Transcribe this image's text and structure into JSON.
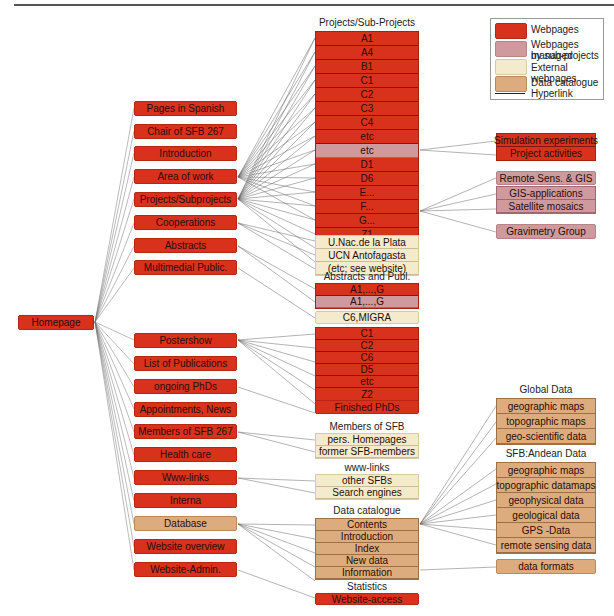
{
  "colors": {
    "webpages": "#d8321c",
    "managed_by_subprojects": "#cf9a9e",
    "external": "#f4ebcc",
    "data_catalogue": "#ddac7e",
    "hyperlink": "#222222"
  },
  "legend": {
    "items": [
      {
        "label": "Webpages",
        "type": "red"
      },
      {
        "label": "Webpages managed by sub-projects",
        "line1": "Webpages managed",
        "line2": "by sub-projects",
        "type": "pink"
      },
      {
        "label": "External webpages",
        "type": "cream"
      },
      {
        "label": "Data catalogue",
        "type": "tan"
      },
      {
        "label": "Hyperlink",
        "type": "line"
      }
    ]
  },
  "root": {
    "label": "Homepage"
  },
  "level1": [
    {
      "label": "Pages in Spanish",
      "type": "red"
    },
    {
      "label": "Chair of SFB 267",
      "type": "red"
    },
    {
      "label": "Introduction",
      "type": "red"
    },
    {
      "label": "Area of work",
      "type": "red"
    },
    {
      "label": "Projects/Subprojects",
      "type": "red"
    },
    {
      "label": "Cooperations",
      "type": "red"
    },
    {
      "label": "Abstracts",
      "type": "red"
    },
    {
      "label": "Multimedial Public.",
      "type": "red"
    },
    {
      "label": "Postershow",
      "type": "red"
    },
    {
      "label": "List of Publications",
      "type": "red"
    },
    {
      "label": "ongoing PhDs",
      "type": "red"
    },
    {
      "label": "Appointments, News",
      "type": "red"
    },
    {
      "label": "Members of SFB 267",
      "type": "red"
    },
    {
      "label": "Health care",
      "type": "red"
    },
    {
      "label": "Www-links",
      "type": "red"
    },
    {
      "label": "Interna",
      "type": "red"
    },
    {
      "label": "Database",
      "type": "tan"
    },
    {
      "label": "Website overview",
      "type": "red"
    },
    {
      "label": "Website-Admin.",
      "type": "red"
    }
  ],
  "projects": {
    "heading": "Projects/Sub-Projects",
    "items": [
      {
        "label": "A1",
        "type": "red"
      },
      {
        "label": "A4",
        "type": "red"
      },
      {
        "label": "B1",
        "type": "red"
      },
      {
        "label": "C1",
        "type": "red"
      },
      {
        "label": "C2",
        "type": "red"
      },
      {
        "label": "C3",
        "type": "red"
      },
      {
        "label": "C4",
        "type": "red"
      },
      {
        "label": "etc",
        "type": "red"
      },
      {
        "label": "etc",
        "type": "pink"
      },
      {
        "label": "D1",
        "type": "red"
      },
      {
        "label": "D6",
        "type": "red"
      },
      {
        "label": "E...",
        "type": "red"
      },
      {
        "label": "F...",
        "type": "red"
      },
      {
        "label": "G...",
        "type": "red"
      },
      {
        "label": "Z1",
        "type": "red"
      },
      {
        "label": "Z2A",
        "type": "pink"
      },
      {
        "label": "Z2B",
        "type": "red"
      }
    ]
  },
  "cooperations": {
    "items": [
      {
        "label": "U.Nac.de la Plata",
        "type": "cream"
      },
      {
        "label": "UCN Antofagasta",
        "type": "cream"
      },
      {
        "label": "(etc; see website)",
        "type": "cream"
      }
    ]
  },
  "abstracts": {
    "heading": "Abstracts and Publ.",
    "items": [
      {
        "label": "A1,...,G",
        "type": "red"
      },
      {
        "label": "A1,...,G",
        "type": "pink"
      }
    ],
    "extra": {
      "label": "C6,MIGRA",
      "type": "cream"
    }
  },
  "postershow": {
    "items": [
      {
        "label": "C1",
        "type": "red"
      },
      {
        "label": "C2",
        "type": "red"
      },
      {
        "label": "C6",
        "type": "red"
      },
      {
        "label": "D5",
        "type": "red"
      },
      {
        "label": "etc",
        "type": "red"
      },
      {
        "label": "Z2",
        "type": "red"
      }
    ]
  },
  "finished_phds": {
    "label": "Finished PhDs",
    "type": "red"
  },
  "members": {
    "heading": "Members of SFB",
    "items": [
      {
        "label": "pers. Homepages",
        "type": "cream"
      },
      {
        "label": "former SFB-members",
        "type": "cream"
      }
    ]
  },
  "wwwlinks": {
    "heading": "www-links",
    "items": [
      {
        "label": "other SFBs",
        "type": "cream"
      },
      {
        "label": "Search engines",
        "type": "cream"
      }
    ]
  },
  "catalogue": {
    "heading": "Data catalogue",
    "items": [
      {
        "label": "Contents",
        "type": "tan"
      },
      {
        "label": "Introduction",
        "type": "tan"
      },
      {
        "label": "Index",
        "type": "tan"
      },
      {
        "label": "New data",
        "type": "tan"
      },
      {
        "label": "Information",
        "type": "tan"
      }
    ]
  },
  "statistics": {
    "heading": "Statistics",
    "items": [
      {
        "label": "Website-access",
        "type": "red"
      }
    ]
  },
  "d6_children": {
    "items": [
      {
        "label": "Simulation experiments",
        "type": "red"
      },
      {
        "label": "Project activities",
        "type": "red"
      }
    ]
  },
  "z2a_children": {
    "items": [
      {
        "label": "Remote Sens. & GIS",
        "type": "pink"
      },
      {
        "label": "GIS-applications",
        "type": "pink"
      },
      {
        "label": "Satellite mosaics",
        "type": "pink"
      }
    ],
    "extra": {
      "label": "Gravimetry Group",
      "type": "pink"
    }
  },
  "global_data": {
    "heading": "Global Data",
    "items": [
      {
        "label": "geographic maps",
        "type": "tan"
      },
      {
        "label": "topographic maps",
        "type": "tan"
      },
      {
        "label": "geo-scientific data",
        "type": "tan"
      }
    ]
  },
  "andean_data": {
    "heading": "SFB:Andean Data",
    "items": [
      {
        "label": "geographic maps",
        "type": "tan"
      },
      {
        "label": "topographic datamaps",
        "type": "tan"
      },
      {
        "label": "geophysical data",
        "type": "tan"
      },
      {
        "label": "geological data",
        "type": "tan"
      },
      {
        "label": "GPS -Data",
        "type": "tan"
      },
      {
        "label": "remote sensing data",
        "type": "tan"
      }
    ]
  },
  "data_formats": {
    "label": "data formats",
    "type": "tan"
  }
}
